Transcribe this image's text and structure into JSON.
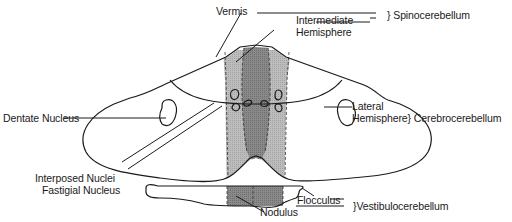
{
  "diagram": {
    "type": "anatomical-line-drawing",
    "colors": {
      "vermis_fill": "#8a8a8a",
      "intermediate_fill": "#b8b8b8",
      "nodulus_fill": "#8a8a8a",
      "outline": "#1a1a1a",
      "background": "#ffffff"
    },
    "labels": {
      "vermis": "Vermis",
      "intermediate_line1": "Intermediate",
      "intermediate_line2": "Hemisphere",
      "spinocerebellum": "} Spinocerebellum",
      "lateral_line1": "Lateral",
      "lateral_line2": "Hemisphere} Cerebrocerebellum",
      "dentate": "Dentate Nucleus",
      "interposed": "Interposed Nuclei",
      "fastigial": "Fastigial Nucleus",
      "flocculus": "Flocculus",
      "nodulus": "Nodulus",
      "vestibulocerebellum": "}Vestibulocerebellum"
    }
  }
}
